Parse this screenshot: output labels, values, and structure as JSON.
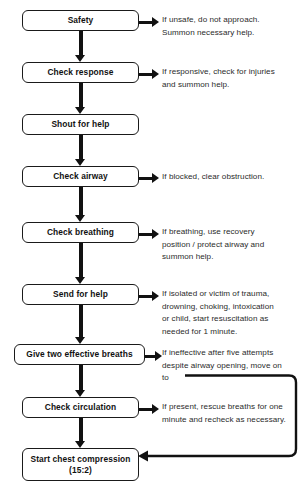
{
  "diagram": {
    "type": "flowchart",
    "stroke_color": "#111111",
    "text_color": "#2b2b2b",
    "steps": [
      {
        "id": "safety",
        "label": "Safety",
        "note": "If unsafe, do not approach.\nSummon necessary help."
      },
      {
        "id": "check-response",
        "label": "Check response",
        "note": "If responsive, check for injuries\nand summon help."
      },
      {
        "id": "shout-for-help",
        "label": "Shout for help",
        "note": ""
      },
      {
        "id": "check-airway",
        "label": "Check airway",
        "note": "If blocked, clear obstruction."
      },
      {
        "id": "check-breathing",
        "label": "Check breathing",
        "note": "If breathing, use recovery\nposition / protect airway and\nsummon help."
      },
      {
        "id": "send-for-help",
        "label": "Send for help",
        "note": "If isolated or victim of trauma,\ndrowning, choking, intoxication\nor child, start resuscitation as\nneeded for 1 minute."
      },
      {
        "id": "give-two-effective-breaths",
        "label": "Give two effective breaths",
        "note": "If ineffective after five attempts\ndespite airway opening, move on\nto"
      },
      {
        "id": "check-circulation",
        "label": "Check circulation",
        "note": "If present, rescue breaths for one\nminute and recheck as necessary."
      },
      {
        "id": "start-chest-compression",
        "label_line1": "Start chest compression",
        "label_line2": "(15:2)",
        "note": ""
      }
    ],
    "caption": ""
  }
}
